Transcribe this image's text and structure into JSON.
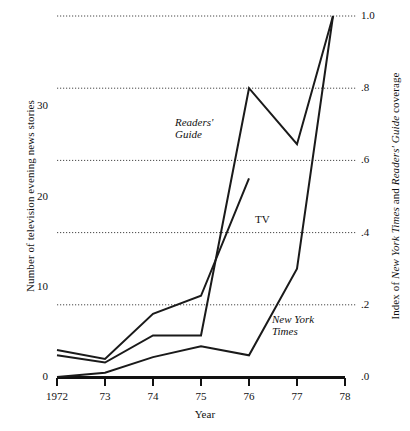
{
  "chart_data": {
    "type": "line",
    "title": "",
    "xlabel": "Year",
    "ylabel_left": "Number of television evening news stories",
    "ylabel_right_parts": [
      {
        "text": "Index of ",
        "style": "normal"
      },
      {
        "text": "New York Times",
        "style": "italic"
      },
      {
        "text": " and ",
        "style": "normal"
      },
      {
        "text": "Readers' Guide",
        "style": "italic"
      },
      {
        "text": " coverage",
        "style": "normal"
      }
    ],
    "ylabel_right": "Index of New York Times and Readers' Guide coverage",
    "x": [
      1972,
      1973,
      1974,
      1975,
      1976,
      1977,
      1978
    ],
    "xtick_labels": [
      "1972",
      "73",
      "74",
      "75",
      "76",
      "77",
      "78"
    ],
    "xlim": [
      1972,
      1978
    ],
    "ylim_left": [
      0,
      40
    ],
    "ytick_values_left": [
      0,
      10,
      20,
      30
    ],
    "ytick_labels_left": [
      "0",
      "10",
      "20",
      "30"
    ],
    "ylim_right": [
      0.0,
      1.0
    ],
    "ytick_values_right": [
      0.0,
      0.2,
      0.4,
      0.6,
      0.8,
      1.0
    ],
    "ytick_labels_right": [
      ".0",
      ".2",
      ".4",
      ".6",
      ".8",
      "1.0"
    ],
    "grid": true,
    "grid_style": "dotted-horizontal",
    "legend": "inline-annotations",
    "line_color": "#1a1a1a",
    "series": [
      {
        "name": "Readers' Guide",
        "axis": "right",
        "label": "Readers' Guide",
        "label_lines": [
          "Readers'",
          "Guide"
        ],
        "label_style": "italic",
        "label_x": 175,
        "label_y": 116,
        "x": [
          1972,
          1973,
          1974,
          1975,
          1976,
          1977,
          1977.75
        ],
        "values": [
          0.06,
          0.04,
          0.115,
          0.115,
          0.8,
          0.645,
          1.0
        ]
      },
      {
        "name": "TV",
        "axis": "left",
        "label": "TV",
        "label_lines": [
          "TV"
        ],
        "label_style": "normal",
        "label_x": 255,
        "label_y": 213,
        "x": [
          1972,
          1973,
          1974,
          1975,
          1976
        ],
        "values": [
          3.0,
          2.0,
          7.0,
          9.0,
          22.0
        ]
      },
      {
        "name": "New York Times",
        "axis": "right",
        "label": "New York Times",
        "label_lines": [
          "New York",
          "Times"
        ],
        "label_style": "italic",
        "label_x": 272,
        "label_y": 313,
        "x": [
          1972,
          1973,
          1974,
          1975,
          1976,
          1977,
          1977.75
        ],
        "values": [
          0.0,
          0.012,
          0.055,
          0.085,
          0.06,
          0.3,
          1.0
        ]
      }
    ]
  }
}
